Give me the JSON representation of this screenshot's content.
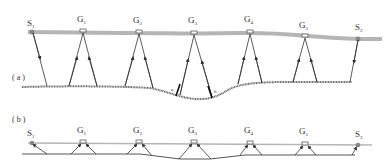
{
  "panel_a": {
    "label": "( a )",
    "source_left": {
      "name": "S",
      "sub": "1",
      "x": 32,
      "y": 31
    },
    "source_right": {
      "name": "S",
      "sub": "2",
      "x": 358,
      "y": 39
    },
    "geophones": [
      {
        "name": "G",
        "sub": "1",
        "x": 83,
        "y": 30
      },
      {
        "name": "G",
        "sub": "2",
        "x": 139,
        "y": 31
      },
      {
        "name": "G",
        "sub": "3",
        "x": 194,
        "y": 32
      },
      {
        "name": "G",
        "sub": "4",
        "x": 250,
        "y": 31
      },
      {
        "name": "G",
        "sub": "5",
        "x": 305,
        "y": 36
      }
    ],
    "markers": [
      {
        "name": "a",
        "x": 176,
        "y": 90
      },
      {
        "name": "b",
        "x": 214,
        "y": 97
      }
    ]
  },
  "panel_b": {
    "label": "( b )",
    "source_left": {
      "name": "S",
      "sub": "1",
      "x": 32,
      "y": 143
    },
    "source_right": {
      "name": "S",
      "sub": "2",
      "x": 358,
      "y": 145
    },
    "geophones": [
      {
        "name": "G",
        "sub": "1",
        "x": 83,
        "y": 142
      },
      {
        "name": "G",
        "sub": "2",
        "x": 139,
        "y": 142
      },
      {
        "name": "G",
        "sub": "3",
        "x": 194,
        "y": 142
      },
      {
        "name": "G",
        "sub": "4",
        "x": 250,
        "y": 143
      },
      {
        "name": "G",
        "sub": "5",
        "x": 305,
        "y": 144
      }
    ]
  },
  "colors": {
    "surface": "#b5b5b5",
    "ray": "#333333",
    "interface": "#555555",
    "text": "#333333"
  }
}
